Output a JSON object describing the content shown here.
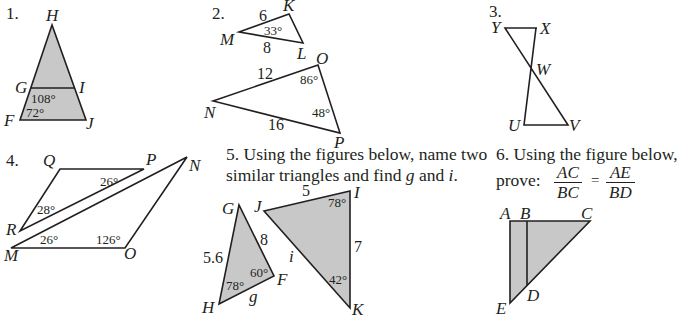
{
  "problems": [
    {
      "number": "1.",
      "figure": "triangle FHJ with segment GI",
      "vertices": {
        "H": "H",
        "G": "G",
        "I": "I",
        "F": "F",
        "J": "J"
      },
      "angles": {
        "HGI": "108°",
        "HFJ": "72°"
      }
    },
    {
      "number": "2.",
      "figure": "triangles MKL and NOP",
      "vertices": {
        "K": "K",
        "M": "M",
        "L": "L",
        "O": "O",
        "N": "N",
        "P": "P"
      },
      "sides": {
        "MK": "6",
        "ML": "8",
        "NO": "12",
        "NP": "16"
      },
      "angles": {
        "M": "33°",
        "O": "86°",
        "P": "48°"
      }
    },
    {
      "number": "3.",
      "figure": "triangles XWY and UWV with parallel segments",
      "vertices": {
        "Y": "Y",
        "X": "X",
        "W": "W",
        "U": "U",
        "V": "V"
      }
    },
    {
      "number": "4.",
      "figure": "triangles QPR and MON with parallel segments",
      "vertices": {
        "Q": "Q",
        "P": "P",
        "N": "N",
        "R": "R",
        "M": "M",
        "O": "O"
      },
      "angles": {
        "P": "26°",
        "R": "28°",
        "M": "26°",
        "O": "126°"
      }
    },
    {
      "number": "5.",
      "text_line1": "5. Using the figures below, name two",
      "text_line2_a": "similar triangles and find ",
      "var_g": "g",
      "text_and": " and ",
      "var_i": "i",
      "text_period": ".",
      "vertices": {
        "G": "G",
        "H": "H",
        "F": "F",
        "J": "J",
        "I": "I",
        "K": "K"
      },
      "sides": {
        "GH": "5.6",
        "GF": "8",
        "HF": "g",
        "JI": "5",
        "IK": "7",
        "JK": "i"
      },
      "angles": {
        "H": "78°",
        "F": "60°",
        "I": "78°",
        "K": "42°"
      }
    },
    {
      "number": "6.",
      "text_line1": "6. Using the figure below,",
      "text_prove": "prove:",
      "fraction_left": {
        "numerator": "AC",
        "denominator": "BC"
      },
      "equals": "=",
      "fraction_right": {
        "numerator": "AE",
        "denominator": "BD"
      },
      "vertices": {
        "A": "A",
        "B": "B",
        "C": "C",
        "D": "D",
        "E": "E"
      }
    }
  ],
  "colors": {
    "fill": "#c8c8c8",
    "stroke": "#231f20",
    "background": "#ffffff"
  }
}
